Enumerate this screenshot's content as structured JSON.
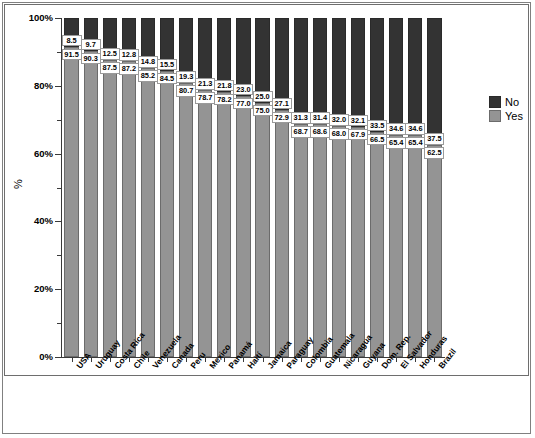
{
  "chart_data": {
    "type": "bar",
    "subtype": "stacked-100-percent",
    "title": "",
    "xlabel": "",
    "ylabel": "%",
    "ylim": [
      0,
      100
    ],
    "ytick_labels": [
      "0%",
      "20%",
      "40%",
      "60%",
      "80%",
      "100%"
    ],
    "ytick_values": [
      0,
      20,
      40,
      60,
      80,
      100
    ],
    "yminor_step": 10,
    "grid": false,
    "legend_position": "right",
    "categories": [
      "USA",
      "Uruguay",
      "Costa Rica",
      "Chile",
      "Venezuela",
      "Canada",
      "Peru",
      "Mexico",
      "Panamá",
      "Haití",
      "Jamaica",
      "Paraguay",
      "Colombia",
      "Guatemala",
      "Nicaragua",
      "Guyana",
      "Dom. Rep.",
      "El Salvador",
      "Honduras",
      "Brazil"
    ],
    "series": [
      {
        "name": "No",
        "color": "#333333",
        "values": [
          8.5,
          9.7,
          12.5,
          12.8,
          14.8,
          15.5,
          19.3,
          21.3,
          21.8,
          23.0,
          25.0,
          27.1,
          31.3,
          31.4,
          32.0,
          32.1,
          33.5,
          34.6,
          34.6,
          37.5
        ]
      },
      {
        "name": "Yes",
        "color": "#949494",
        "values": [
          91.5,
          90.3,
          87.5,
          87.2,
          85.2,
          84.5,
          80.7,
          78.7,
          78.2,
          77.0,
          75.0,
          72.9,
          68.7,
          68.6,
          68.0,
          67.9,
          66.5,
          65.4,
          65.4,
          62.5
        ]
      }
    ],
    "legend": [
      {
        "label": "No",
        "color": "#333333"
      },
      {
        "label": "Yes",
        "color": "#949494"
      }
    ]
  }
}
